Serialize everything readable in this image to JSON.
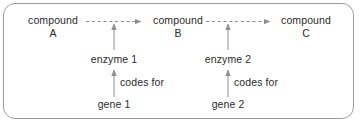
{
  "diagram": {
    "frame": {
      "border_color": "#9d9d9d",
      "background": "#ffffff"
    },
    "line_color": "#8f8f8f",
    "text_color": "#2b2b2b",
    "compounds": [
      {
        "name": "compound",
        "label": "A"
      },
      {
        "name": "compound",
        "label": "B"
      },
      {
        "name": "compound",
        "label": "C"
      }
    ],
    "enzymes": [
      {
        "label": "enzyme 1"
      },
      {
        "label": "enzyme 2"
      }
    ],
    "genes": [
      {
        "label": "gene 1"
      },
      {
        "label": "gene 2"
      }
    ],
    "relations": [
      {
        "label": "codes for"
      },
      {
        "label": "codes for"
      }
    ],
    "arrows": {
      "reaction_style": "dashed",
      "catalysis_style": "solid",
      "expression_style": "solid"
    }
  }
}
